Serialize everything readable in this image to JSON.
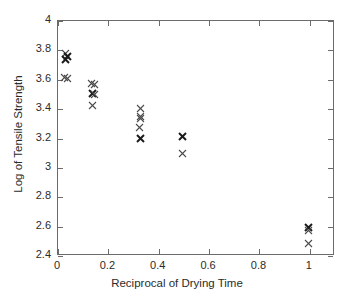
{
  "chart_data": {
    "type": "scatter",
    "title": "",
    "xlabel": "Reciprocal of Drying Time",
    "ylabel": "Log of Tensile Strength",
    "xlim": [
      0,
      1.1
    ],
    "ylim": [
      2.4,
      4.0
    ],
    "xticks": [
      0,
      0.2,
      0.4,
      0.6,
      0.8,
      1
    ],
    "xtick_labels": [
      "0",
      "0.2",
      "0.4",
      "0.6",
      "0.8",
      "1"
    ],
    "yticks": [
      2.4,
      2.6,
      2.8,
      3.0,
      3.2,
      3.4,
      3.6,
      3.8,
      4.0
    ],
    "ytick_labels": [
      "2.4",
      "2.6",
      "2.8",
      "3",
      "3.2",
      "3.4",
      "3.6",
      "3.8",
      "4"
    ],
    "grid": false,
    "legend": null,
    "marker": "x",
    "marker_color": "#4a4a4a",
    "points": [
      {
        "x": 0.033,
        "y": 3.77,
        "bold": false
      },
      {
        "x": 0.04,
        "y": 3.75,
        "bold": true
      },
      {
        "x": 0.035,
        "y": 3.73,
        "bold": true
      },
      {
        "x": 0.03,
        "y": 3.61,
        "bold": false
      },
      {
        "x": 0.04,
        "y": 3.6,
        "bold": false
      },
      {
        "x": 0.138,
        "y": 3.57,
        "bold": false
      },
      {
        "x": 0.148,
        "y": 3.56,
        "bold": false
      },
      {
        "x": 0.14,
        "y": 3.5,
        "bold": true
      },
      {
        "x": 0.148,
        "y": 3.49,
        "bold": false
      },
      {
        "x": 0.142,
        "y": 3.42,
        "bold": false
      },
      {
        "x": 0.333,
        "y": 3.4,
        "bold": false
      },
      {
        "x": 0.33,
        "y": 3.34,
        "bold": false
      },
      {
        "x": 0.333,
        "y": 3.33,
        "bold": false
      },
      {
        "x": 0.328,
        "y": 3.27,
        "bold": false
      },
      {
        "x": 0.33,
        "y": 3.19,
        "bold": true
      },
      {
        "x": 0.5,
        "y": 3.21,
        "bold": true
      },
      {
        "x": 0.5,
        "y": 3.09,
        "bold": false
      },
      {
        "x": 1.0,
        "y": 2.59,
        "bold": true
      },
      {
        "x": 1.0,
        "y": 2.57,
        "bold": false
      },
      {
        "x": 1.0,
        "y": 2.48,
        "bold": false
      }
    ]
  }
}
